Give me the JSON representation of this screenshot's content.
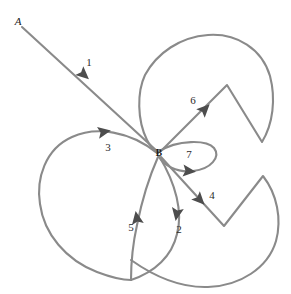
{
  "diagram": {
    "type": "directed-graph",
    "title": "",
    "stroke_color": "#8a8a8a",
    "arrow_color": "#4d4d4d",
    "background_color": "#ffffff",
    "nodes": [
      {
        "id": "A",
        "label": "A",
        "x": 18,
        "y": 22,
        "style": "italic"
      },
      {
        "id": "B",
        "label": "B",
        "x": 159,
        "y": 154,
        "style": "bold"
      }
    ],
    "edges": [
      {
        "id": "e1",
        "label": "1",
        "from": "A",
        "to": "B",
        "label_x": 89,
        "label_y": 63,
        "path": "M 22 27 L 158 152",
        "arrow": {
          "x": 83,
          "y": 74,
          "angle": 42
        }
      },
      {
        "id": "e2",
        "label": "2",
        "from": "B",
        "to": "B",
        "label_x": 179,
        "label_y": 230,
        "path": "M 159 156 C 176 184 183 212 177 234 C 172 256 155 272 131 280",
        "arrow": {
          "x": 177,
          "y": 213,
          "angle": 100
        }
      },
      {
        "id": "e3",
        "label": "3",
        "from": "B",
        "to": "B",
        "label_x": 108,
        "label_y": 148,
        "path": "M 157 153 C 130 131 96 126 72 137 C 45 149 36 179 40 204 C 44 234 66 260 97 272 C 118 280 126 280 131 280",
        "arrow": {
          "x": 103,
          "y": 132,
          "angle": -10
        }
      },
      {
        "id": "e4",
        "label": "4",
        "from": "B",
        "to": "B",
        "label_x": 212,
        "label_y": 196,
        "path": "M 161 157 L 224 226 L 263 176 C 277 194 282 219 276 241 C 268 268 240 286 208 287 C 180 288 155 277 131 260",
        "arrow": {
          "x": 199,
          "y": 199,
          "angle": 46
        }
      },
      {
        "id": "e5",
        "label": "5",
        "from": "B",
        "to": "B",
        "label_x": 131,
        "label_y": 228,
        "path": "M 131 280 C 131 265 133 243 137 225 C 142 200 150 175 158 157",
        "arrow": {
          "x": 137,
          "y": 219,
          "angle": -100
        }
      },
      {
        "id": "e6",
        "label": "6",
        "from": "B",
        "to": "B",
        "label_x": 193,
        "label_y": 101,
        "path": "M 161 151 L 227 85 L 262 142 C 273 124 276 99 270 76 C 262 49 237 33 208 35 C 180 37 157 53 145 75 C 137 92 137 120 147 140 C 151 148 154 150 158 153",
        "arrow": {
          "x": 204,
          "y": 110,
          "angle": -45
        }
      },
      {
        "id": "e7",
        "label": "7",
        "from": "B",
        "to": "B",
        "label_x": 189,
        "label_y": 155,
        "path": "M 158 152 C 178 139 207 140 214 148 C 221 157 211 169 193 171 C 176 173 164 165 159 157",
        "arrow": {
          "x": 188,
          "y": 171,
          "angle": 5
        }
      }
    ]
  }
}
